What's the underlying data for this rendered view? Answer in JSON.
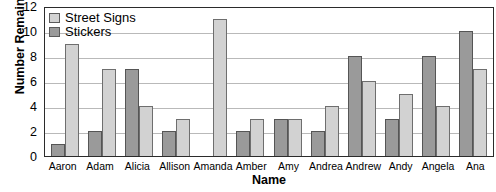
{
  "chart_data": {
    "type": "bar",
    "title": "Graph of Results for Survey",
    "xlabel": "Name",
    "ylabel": "Number Remaining",
    "ylim": [
      0,
      12
    ],
    "yticks": [
      0,
      2,
      4,
      6,
      8,
      10,
      12
    ],
    "grid": true,
    "legend_position": "top-left",
    "categories": [
      "Aaron",
      "Adam",
      "Alicia",
      "Allison",
      "Amanda",
      "Amber",
      "Amy",
      "Andrea",
      "Andrew",
      "Andy",
      "Angela",
      "Ana"
    ],
    "series": [
      {
        "name": "Stickers",
        "color": "#9a9a9a",
        "values": [
          1,
          2,
          7,
          2,
          0,
          2,
          3,
          2,
          8,
          3,
          8,
          10
        ]
      },
      {
        "name": "Street Signs",
        "color": "#d2d2d2",
        "values": [
          9,
          7,
          4,
          3,
          11,
          3,
          3,
          4,
          6,
          5,
          4,
          7
        ]
      }
    ]
  }
}
